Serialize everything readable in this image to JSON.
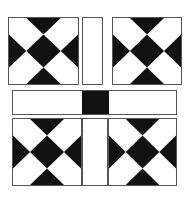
{
  "diagram": {
    "colors": {
      "dark": "#111111",
      "light": "#ffffff",
      "border": "#555555"
    },
    "pieces": [
      {
        "name": "top-left-hourglass-block",
        "type": "hourglass-x",
        "x": 8,
        "y": 17,
        "w": 71,
        "h": 68
      },
      {
        "name": "top-center-vertical-strip",
        "type": "blank",
        "x": 82,
        "y": 17,
        "w": 21,
        "h": 68
      },
      {
        "name": "top-right-hourglass-block",
        "type": "hourglass-x",
        "x": 112,
        "y": 17,
        "w": 70,
        "h": 68
      },
      {
        "name": "middle-horizontal-sash",
        "type": "sash-with-center",
        "x": 12,
        "y": 90,
        "w": 165,
        "h": 25
      },
      {
        "name": "bottom-left-hourglass-block",
        "type": "hourglass-x",
        "x": 12,
        "y": 118,
        "w": 70,
        "h": 68
      },
      {
        "name": "bottom-center-vertical-strip",
        "type": "blank",
        "x": 82,
        "y": 118,
        "w": 26,
        "h": 68
      },
      {
        "name": "bottom-right-hourglass-block",
        "type": "hourglass-x",
        "x": 108,
        "y": 118,
        "w": 69,
        "h": 68
      }
    ]
  }
}
